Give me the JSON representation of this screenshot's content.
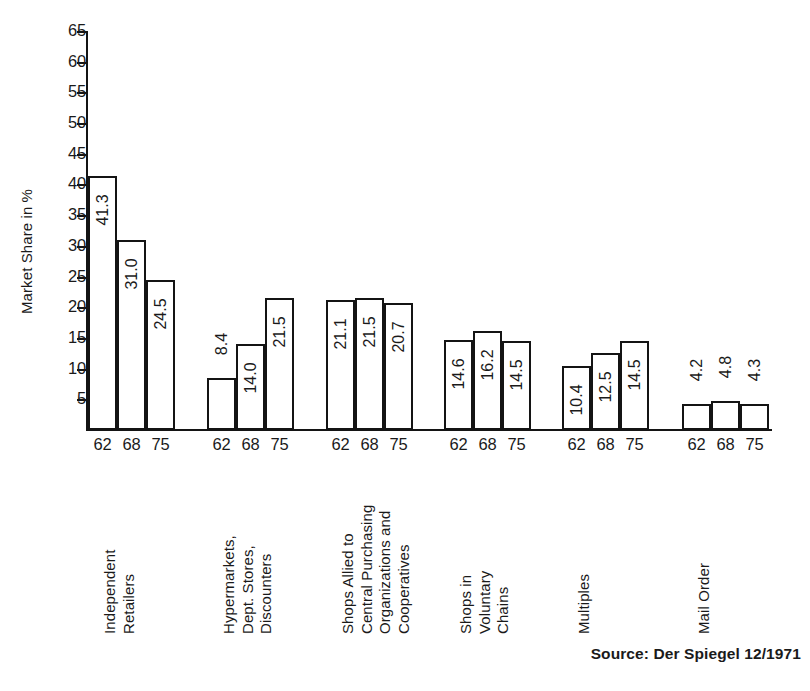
{
  "chart_data": {
    "type": "bar",
    "title": "",
    "xlabel": "",
    "ylabel": "Market Share in %",
    "ylim": [
      0,
      65
    ],
    "ytick_step": 5,
    "yticks": [
      65,
      60,
      55,
      50,
      45,
      40,
      35,
      30,
      25,
      20,
      15,
      10,
      5
    ],
    "grid": false,
    "legend": "none",
    "categories": [
      "Independent\nRetailers",
      "Hypermarkets,\nDept. Stores,\nDiscounters",
      "Shops Allied to\nCentral Purchasing\nOrganizations and\nCooperatives",
      "Shops in\nVoluntary\nChains",
      "Multiples",
      "Mail Order"
    ],
    "group_tick_labels": [
      "62",
      "68",
      "75"
    ],
    "series": [
      {
        "name": "62",
        "values": [
          41.3,
          8.4,
          21.1,
          14.6,
          10.4,
          4.2
        ]
      },
      {
        "name": "68",
        "values": [
          31.0,
          14.0,
          21.5,
          16.2,
          12.5,
          4.8
        ]
      },
      {
        "name": "75",
        "values": [
          24.5,
          21.5,
          20.7,
          14.5,
          14.5,
          4.3
        ]
      }
    ],
    "groups": [
      {
        "label": "Independent\nRetailers",
        "bars": [
          {
            "year": "62",
            "value": 41.3,
            "value_label": "41.3"
          },
          {
            "year": "68",
            "value": 31.0,
            "value_label": "31.0"
          },
          {
            "year": "75",
            "value": 24.5,
            "value_label": "24.5"
          }
        ]
      },
      {
        "label": "Hypermarkets,\nDept. Stores,\nDiscounters",
        "bars": [
          {
            "year": "62",
            "value": 8.4,
            "value_label": "8.4"
          },
          {
            "year": "68",
            "value": 14.0,
            "value_label": "14.0"
          },
          {
            "year": "75",
            "value": 21.5,
            "value_label": "21.5"
          }
        ]
      },
      {
        "label": "Shops Allied to\nCentral Purchasing\nOrganizations and\nCooperatives",
        "bars": [
          {
            "year": "62",
            "value": 21.1,
            "value_label": "21.1"
          },
          {
            "year": "68",
            "value": 21.5,
            "value_label": "21.5"
          },
          {
            "year": "75",
            "value": 20.7,
            "value_label": "20.7"
          }
        ]
      },
      {
        "label": "Shops in\nVoluntary\nChains",
        "bars": [
          {
            "year": "62",
            "value": 14.6,
            "value_label": "14.6"
          },
          {
            "year": "68",
            "value": 16.2,
            "value_label": "16.2"
          },
          {
            "year": "75",
            "value": 14.5,
            "value_label": "14.5"
          }
        ]
      },
      {
        "label": "Multiples",
        "bars": [
          {
            "year": "62",
            "value": 10.4,
            "value_label": "10.4"
          },
          {
            "year": "68",
            "value": 12.5,
            "value_label": "12.5"
          },
          {
            "year": "75",
            "value": 14.5,
            "value_label": "14.5"
          }
        ]
      },
      {
        "label": "Mail Order",
        "bars": [
          {
            "year": "62",
            "value": 4.2,
            "value_label": "4.2"
          },
          {
            "year": "68",
            "value": 4.8,
            "value_label": "4.8"
          },
          {
            "year": "75",
            "value": 4.3,
            "value_label": "4.3"
          }
        ]
      }
    ],
    "annotations": {
      "source": "Source: Der Spiegel 12/1971"
    },
    "colors": {
      "bar_fill": "#ffffff",
      "bar_stroke": "#141414",
      "axis": "#141414",
      "text": "#1a1a1a",
      "background": "#ffffff"
    }
  }
}
